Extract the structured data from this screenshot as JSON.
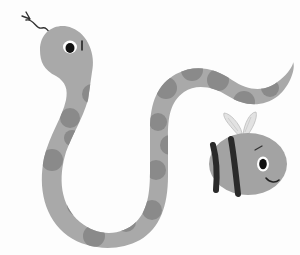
{
  "scene": {
    "description": "Cartoon illustration of a spotted snake and a smiling bee",
    "background": "#fdfdfd"
  },
  "snake": {
    "label": "snake",
    "body_color": "#a9a9a9",
    "spot_color": "#8a8a8a",
    "eye_color": "#111111",
    "tongue_color": "#333333"
  },
  "bee": {
    "label": "bee",
    "body_color": "#a3a3a3",
    "stripe_color": "#2a2a2a",
    "wing_color": "#d6d6d6"
  }
}
